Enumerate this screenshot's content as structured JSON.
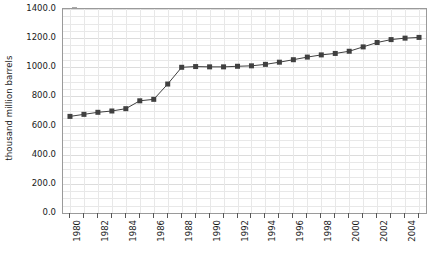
{
  "chart_data": {
    "type": "line",
    "title": "",
    "xlabel": "",
    "ylabel": "thousand million barrels",
    "xlim": [
      1979.5,
      2005.5
    ],
    "ylim": [
      0.0,
      1400.0
    ],
    "grid": true,
    "legend": "none",
    "marker": "square",
    "series_color": "#404040",
    "grid_color": "#e8e8e8",
    "axis_color": "#9a9a9a",
    "x": [
      1980,
      1981,
      1982,
      1983,
      1984,
      1985,
      1986,
      1987,
      1988,
      1989,
      1990,
      1991,
      1992,
      1993,
      1994,
      1995,
      1996,
      1997,
      1998,
      1999,
      2000,
      2001,
      2002,
      2003,
      2004,
      2005
    ],
    "values": [
      663,
      677,
      691,
      700,
      716,
      770,
      780,
      885,
      1000,
      1005,
      1003,
      1003,
      1007,
      1010,
      1020,
      1035,
      1052,
      1070,
      1085,
      1095,
      1110,
      1140,
      1170,
      1190,
      1200,
      1205
    ],
    "y_ticks": [
      0.0,
      200.0,
      400.0,
      600.0,
      800.0,
      1000.0,
      1200.0,
      1400.0
    ],
    "y_tick_labels": [
      "0.0",
      "200.0",
      "400.0",
      "600.0",
      "800.0",
      "1000.0",
      "1200.0",
      "1400.0"
    ],
    "y_minor_step": 50,
    "x_ticks": [
      1980,
      1981,
      1982,
      1983,
      1984,
      1985,
      1986,
      1987,
      1988,
      1989,
      1990,
      1991,
      1992,
      1993,
      1994,
      1995,
      1996,
      1997,
      1998,
      1999,
      2000,
      2001,
      2002,
      2003,
      2004,
      2005
    ],
    "x_tick_labels": [
      "1980",
      "",
      "1982",
      "",
      "1984",
      "",
      "1986",
      "",
      "1988",
      "",
      "1990",
      "",
      "1992",
      "",
      "1994",
      "",
      "1996",
      "",
      "1998",
      "",
      "2000",
      "",
      "2002",
      "",
      "2004",
      ""
    ]
  }
}
